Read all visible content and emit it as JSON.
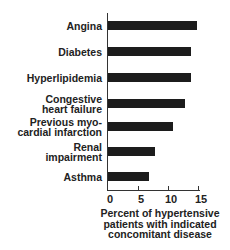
{
  "chart_data": {
    "type": "bar",
    "orientation": "horizontal",
    "title": "",
    "categories": [
      "Angina",
      "Diabetes",
      "Hyperlipidemia",
      "Congestive heart failure",
      "Previous myocardial infarction",
      "Renal impairment",
      "Asthma"
    ],
    "category_labels": [
      [
        "Angina"
      ],
      [
        "Diabetes"
      ],
      [
        "Hyperlipidemia"
      ],
      [
        "Congestive",
        "heart failure"
      ],
      [
        "Previous myo-",
        "cardial infarction"
      ],
      [
        "Renal",
        "impairment"
      ],
      [
        "Asthma"
      ]
    ],
    "values": [
      15,
      14,
      14,
      13,
      11,
      8,
      7
    ],
    "xlabel": "Percent of hypertensive patients with indicated concomitant disease",
    "xlabel_lines": [
      "Percent of hypertensive",
      "patients with indicated",
      "concomitant disease"
    ],
    "ylabel": "",
    "xlim": [
      0,
      15
    ],
    "xticks": [
      0,
      5,
      10,
      15
    ],
    "grid": false,
    "legend": null,
    "bar_color": "#1c1c1c"
  }
}
